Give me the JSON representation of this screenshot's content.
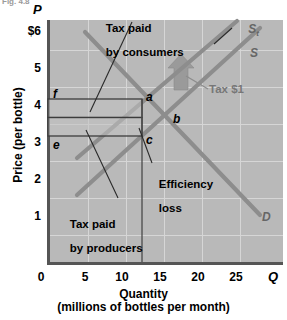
{
  "figure": {
    "caption_fragment": "Fig. 4.8",
    "axis_labels": {
      "y_symbol": "P",
      "x_symbol": "Q",
      "y_title": "Price (per bottle)",
      "x_title_line1": "Quantity",
      "x_title_line2": "(millions of bottles per month)"
    }
  },
  "chart_data": {
    "type": "line",
    "title": "",
    "xlabel": "Quantity (millions of bottles per month)",
    "ylabel": "Price (per bottle)",
    "xlim": [
      0,
      31
    ],
    "ylim": [
      0,
      6.6
    ],
    "xticks": [
      0,
      5,
      10,
      15,
      20,
      25
    ],
    "xtick_labels": [
      "0",
      "5",
      "10",
      "15",
      "20",
      "25"
    ],
    "yticks": [
      1,
      2,
      3,
      4,
      5,
      6
    ],
    "ytick_labels": [
      "1",
      "2",
      "3",
      "4",
      "5",
      "$6"
    ],
    "grid": true,
    "legend_position": "inline-curve-labels",
    "series": [
      {
        "name": "S",
        "label": "S",
        "role": "supply-before-tax",
        "color": "#8d8d8d",
        "x": [
          4,
          28
        ],
        "y": [
          1.9,
          6.4
        ],
        "label_at": [
          25.5,
          5.6
        ]
      },
      {
        "name": "St",
        "label": "St",
        "role": "supply-after-tax",
        "color": "#8d8d8d",
        "x": [
          4,
          25
        ],
        "y": [
          2.9,
          6.6
        ],
        "label_at": [
          23.5,
          6.45
        ]
      },
      {
        "name": "D",
        "label": "D",
        "role": "demand",
        "color": "#8d8d8d",
        "x": [
          5,
          28
        ],
        "y": [
          6.3,
          1.35
        ],
        "label_at": [
          27.5,
          1.35
        ]
      }
    ],
    "points": [
      {
        "label": "a",
        "x": 12.5,
        "y": 4.5,
        "note": "after-tax equilibrium (consumer price)"
      },
      {
        "label": "b",
        "x": 15.0,
        "y": 4.0,
        "note": "pre-tax equilibrium"
      },
      {
        "label": "c",
        "x": 12.5,
        "y": 3.5,
        "note": "net price received by producers"
      },
      {
        "label": "f",
        "x": 0.0,
        "y": 4.5,
        "note": "price axis at consumer price"
      },
      {
        "label": "e",
        "x": 0.0,
        "y": 3.5,
        "note": "price axis at producer price"
      }
    ],
    "regions": [
      {
        "name": "tax-paid-by-consumers",
        "x_range": [
          0,
          12.5
        ],
        "y_range": [
          4.0,
          4.5
        ]
      },
      {
        "name": "tax-paid-by-producers",
        "x_range": [
          0,
          12.5
        ],
        "y_range": [
          3.5,
          4.0
        ]
      },
      {
        "name": "efficiency-loss",
        "vertices": [
          [
            12.5,
            4.5
          ],
          [
            15,
            4.0
          ],
          [
            12.5,
            3.5
          ]
        ]
      }
    ]
  },
  "annotations": {
    "consumers": {
      "line1": "Tax paid",
      "line2": "by consumers"
    },
    "producers": {
      "line1": "Tax paid",
      "line2": "by producers"
    },
    "efficiency": {
      "line1": "Efficiency",
      "line2": "loss"
    },
    "tax_amount": "Tax $1"
  },
  "colors": {
    "plot_background": "#b9b9b9",
    "gridline": "#d6d6d6",
    "curve": "#8d8d8d",
    "axis": "#555555",
    "annotation_text": "#000000",
    "tax_label": "#777777",
    "shift_arrow": "#9a9a9a"
  }
}
